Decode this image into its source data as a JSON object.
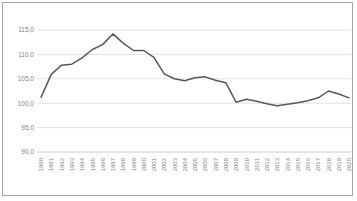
{
  "chart_data": {
    "type": "line",
    "title": "",
    "subtitle": "",
    "xlabel": "",
    "ylabel": "",
    "ylim": [
      90.0,
      115.0
    ],
    "yticks": [
      "90,0",
      "95,0",
      "100,0",
      "105,0",
      "110,0",
      "115,0"
    ],
    "ytick_values": [
      90.0,
      95.0,
      100.0,
      105.0,
      110.0,
      115.0
    ],
    "grid": "horizontal",
    "legend": "none",
    "line_color": "#595959",
    "grid_color": "#d9d9d9",
    "border_color": "#a6a6a6",
    "categories": [
      "1990",
      "1991",
      "1992",
      "1993",
      "1994",
      "1995",
      "1996",
      "1997",
      "1998",
      "1999",
      "2000",
      "2001",
      "2002",
      "2003",
      "2004",
      "2005",
      "2006",
      "2007",
      "2008",
      "2009",
      "2010",
      "2011",
      "2012",
      "2013",
      "2014",
      "2015",
      "2016",
      "2017",
      "2018",
      "2019",
      "2020"
    ],
    "series": [
      {
        "name": "Index",
        "values": [
          101.2,
          105.9,
          107.8,
          108.0,
          109.3,
          111.0,
          112.0,
          114.2,
          112.3,
          110.8,
          110.8,
          109.4,
          106.0,
          105.0,
          104.6,
          105.2,
          105.4,
          104.7,
          104.2,
          100.2,
          100.8,
          100.4,
          99.9,
          99.5,
          99.8,
          100.1,
          100.5,
          101.1,
          102.5,
          101.9,
          101.1
        ]
      }
    ]
  }
}
